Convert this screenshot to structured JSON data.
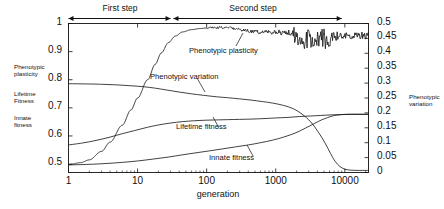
{
  "chart_data": {
    "type": "line",
    "title": "",
    "xlabel": "generation",
    "xscale": "log",
    "xlim": [
      1,
      22000
    ],
    "xticks": [
      1,
      10,
      100,
      1000,
      10000
    ],
    "xticklabels": [
      "1",
      "10",
      "100",
      "1000",
      "10000"
    ],
    "y_left_label": "",
    "ylim_left": [
      0.47,
      1.0
    ],
    "yticks_left": [
      0.5,
      0.6,
      0.7,
      0.8,
      0.9,
      1
    ],
    "yticklabels_left": [
      "0.5",
      "0.6",
      "0.7",
      "0.8",
      "0.9",
      "1"
    ],
    "y_right_label": "Phenotypic variation",
    "ylim_right": [
      0.0,
      0.5
    ],
    "yticks_right": [
      0,
      0.05,
      0.1,
      0.15,
      0.2,
      0.25,
      0.3,
      0.35,
      0.4,
      0.45,
      0.5
    ],
    "yticklabels_right": [
      "0",
      "0.05",
      "0.1",
      "0.15",
      "0.2",
      "0.25",
      "0.3",
      "0.35",
      "0.4",
      "0.45",
      "0.5"
    ],
    "grid": false,
    "legend_position": "inline-annotations",
    "line_color": "#111111",
    "series": [
      {
        "name": "Phenotypic plasticity",
        "axis": "left",
        "noisy_after": 100,
        "x": [
          1,
          1.5,
          2,
          3,
          4,
          6,
          8,
          10,
          14,
          18,
          22,
          28,
          35,
          45,
          60,
          80,
          100,
          140,
          200,
          260,
          340,
          440,
          560,
          700,
          900,
          1100,
          1400,
          1700,
          2000,
          2400,
          2900,
          3400,
          4000,
          4800,
          5600,
          6600,
          8000,
          10000,
          12000,
          15000,
          18000,
          22000
        ],
        "y": [
          0.498,
          0.505,
          0.515,
          0.545,
          0.578,
          0.638,
          0.692,
          0.735,
          0.8,
          0.855,
          0.895,
          0.932,
          0.955,
          0.97,
          0.978,
          0.982,
          0.984,
          0.985,
          0.986,
          0.982,
          0.975,
          0.972,
          0.97,
          0.968,
          0.966,
          0.968,
          0.972,
          0.966,
          0.95,
          0.938,
          0.945,
          0.935,
          0.946,
          0.948,
          0.952,
          0.955,
          0.956,
          0.957,
          0.957,
          0.958,
          0.958,
          0.958
        ]
      },
      {
        "name": "Phenotypic variation",
        "axis": "right",
        "x": [
          1,
          2,
          3,
          5,
          8,
          12,
          18,
          26,
          40,
          60,
          90,
          140,
          200,
          300,
          440,
          640,
          900,
          1300,
          1800,
          2400,
          3200,
          4200,
          5200,
          6200,
          7200,
          8500,
          10000,
          12000,
          15000,
          18000,
          22000
        ],
        "y": [
          0.298,
          0.297,
          0.296,
          0.294,
          0.291,
          0.288,
          0.283,
          0.277,
          0.27,
          0.264,
          0.259,
          0.254,
          0.251,
          0.247,
          0.243,
          0.238,
          0.233,
          0.225,
          0.214,
          0.196,
          0.17,
          0.133,
          0.098,
          0.064,
          0.038,
          0.02,
          0.011,
          0.008,
          0.007,
          0.007,
          0.007
        ]
      },
      {
        "name": "Lifetime fitness",
        "axis": "left",
        "x": [
          1,
          1.6,
          2.5,
          4,
          6,
          9,
          14,
          20,
          30,
          45,
          65,
          95,
          140,
          200,
          300,
          450,
          700,
          1000,
          1500,
          2200,
          3200,
          4500,
          6500,
          9000,
          12000,
          16000,
          22000
        ],
        "y": [
          0.568,
          0.575,
          0.584,
          0.596,
          0.608,
          0.619,
          0.631,
          0.639,
          0.646,
          0.651,
          0.654,
          0.656,
          0.657,
          0.658,
          0.659,
          0.66,
          0.662,
          0.664,
          0.666,
          0.669,
          0.671,
          0.673,
          0.675,
          0.676,
          0.677,
          0.677,
          0.677
        ]
      },
      {
        "name": "Innate fitness",
        "axis": "left",
        "x": [
          1,
          2,
          3.5,
          6,
          10,
          17,
          28,
          45,
          70,
          110,
          170,
          260,
          400,
          600,
          900,
          1300,
          1900,
          2700,
          3600,
          4600,
          5600,
          6600,
          7600,
          9000,
          11000,
          14000,
          18000,
          22000
        ],
        "y": [
          0.497,
          0.499,
          0.502,
          0.506,
          0.511,
          0.518,
          0.525,
          0.533,
          0.54,
          0.547,
          0.554,
          0.561,
          0.568,
          0.576,
          0.585,
          0.596,
          0.61,
          0.628,
          0.644,
          0.657,
          0.665,
          0.671,
          0.674,
          0.676,
          0.677,
          0.677,
          0.677,
          0.677
        ]
      }
    ],
    "annotations": [
      {
        "name": "first-step",
        "text": "First step",
        "x_start": 1,
        "x_end": 30
      },
      {
        "name": "second-step",
        "text": "Second step",
        "x_start": 33,
        "x_end": 9000
      }
    ]
  },
  "left_side_labels": [
    {
      "line1": "Phenotypic",
      "line2": "plasticity"
    },
    {
      "line1": "Lifetime",
      "line2": "Fitness"
    },
    {
      "line1": "Innate",
      "line2": "fitness"
    }
  ],
  "right_side_label": {
    "line1": "Phenotypic",
    "line2": "variation"
  },
  "curve_labels": {
    "plasticity": "Phenotypic plasticity",
    "variation": "Phenotypic variation",
    "lifetime": "Lifetime fitness",
    "innate": "Innate fitness"
  },
  "steps": {
    "first": "First step",
    "second": "Second step"
  },
  "axis_titles": {
    "x": "generation"
  }
}
